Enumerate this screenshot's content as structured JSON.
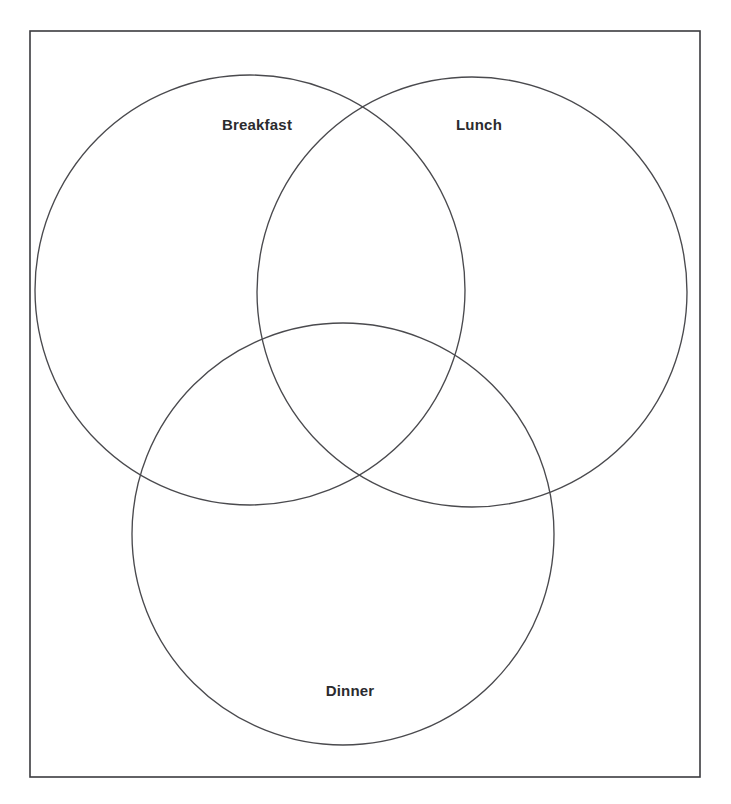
{
  "diagram": {
    "type": "venn",
    "title": "",
    "background_color": "#ffffff",
    "frame": {
      "name": "diagram-border",
      "x": 30,
      "y": 31,
      "width": 670,
      "height": 746,
      "stroke_color": "#3b3b3f",
      "stroke_width": 1.6,
      "fill": "none"
    },
    "sets": [
      {
        "id": "breakfast",
        "label": "Breakfast",
        "cx": 250,
        "cy": 290,
        "r": 215,
        "stroke_color": "#4a4a4e",
        "stroke_width": 1.35,
        "fill": "none",
        "label_x": 257,
        "label_y": 124
      },
      {
        "id": "lunch",
        "label": "Lunch",
        "cx": 472,
        "cy": 292,
        "r": 215,
        "stroke_color": "#4a4a4e",
        "stroke_width": 1.35,
        "fill": "none",
        "label_x": 479,
        "label_y": 124
      },
      {
        "id": "dinner",
        "label": "Dinner",
        "cx": 343,
        "cy": 534,
        "r": 211,
        "stroke_color": "#4a4a4e",
        "stroke_width": 1.35,
        "fill": "none",
        "label_x": 350,
        "label_y": 690
      }
    ],
    "regions": {
      "breakfast_only": "",
      "lunch_only": "",
      "dinner_only": "",
      "breakfast_lunch": "",
      "breakfast_dinner": "",
      "lunch_dinner": "",
      "breakfast_lunch_dinner": ""
    }
  }
}
